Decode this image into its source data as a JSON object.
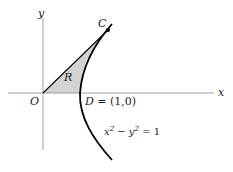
{
  "figure": {
    "axis_x_label": "x",
    "axis_y_label": "y",
    "origin_label": "O",
    "point_c_label": "C",
    "point_d_label": "D",
    "point_d_coords": "= (1,0)",
    "region_label": "R",
    "curve_equation": {
      "lhs_x": "x",
      "exp1": "2",
      "minus": " − y",
      "exp2": "2",
      "rhs": " = 1"
    },
    "colors": {
      "axis": "#888888",
      "curve": "#000000",
      "region_fill": "#d3d3d3"
    }
  }
}
